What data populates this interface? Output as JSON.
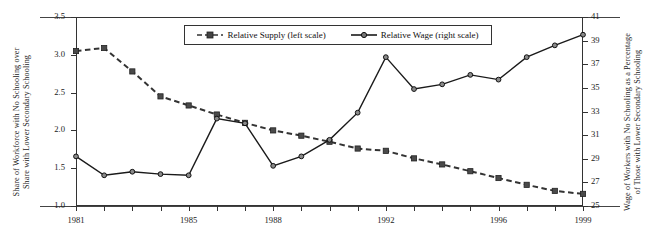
{
  "chart_data": {
    "type": "line",
    "title": "",
    "subtitle": "",
    "xlabel": "",
    "ylabel": "Share of Workforce with No Schooling over Share with Lower Secondary Schooling",
    "ylabel_right": "Wage of Workers with No Schooling as a Percentage of Those with Lower Secondary Schooling",
    "x": [
      1981,
      1982,
      1983,
      1984,
      1985,
      1986,
      1987,
      1988,
      1989,
      1990,
      1991,
      1992,
      1993,
      1994,
      1995,
      1996,
      1997,
      1998,
      1999
    ],
    "xtick_labels": [
      "1981",
      "1985",
      "1988",
      "1992",
      "1996",
      "1999"
    ],
    "xtick_values": [
      1981,
      1985,
      1988,
      1992,
      1996,
      1999
    ],
    "ylim": [
      1.0,
      3.5
    ],
    "ytick_labels": [
      "3.5",
      "3.0",
      "2.5",
      "2.0",
      "1.5",
      "1.0"
    ],
    "ytick_values": [
      3.5,
      3.0,
      2.5,
      2.0,
      1.5,
      1.0
    ],
    "ylim_right": [
      25,
      41
    ],
    "ytick_labels_right": [
      "41",
      "39",
      "37",
      "35",
      "33",
      "31",
      "29",
      "27",
      "25"
    ],
    "ytick_values_right": [
      41,
      39,
      37,
      35,
      33,
      31,
      29,
      27,
      25
    ],
    "grid": false,
    "legend_position": "top-center",
    "series": [
      {
        "name": "Relative Supply (left scale)",
        "axis": "left",
        "line_style": "dashed",
        "marker": "square",
        "color": "#333333",
        "values": [
          3.05,
          3.09,
          2.78,
          2.45,
          2.33,
          2.21,
          2.1,
          2.0,
          1.93,
          1.85,
          1.76,
          1.73,
          1.63,
          1.55,
          1.46,
          1.37,
          1.28,
          1.2,
          1.16
        ]
      },
      {
        "name": "Relative Wage (right scale)",
        "axis": "right",
        "line_style": "solid",
        "marker": "circle",
        "color": "#1a1a1a",
        "values": [
          29.2,
          27.6,
          27.9,
          27.7,
          27.6,
          32.4,
          32.0,
          28.4,
          29.2,
          30.6,
          32.9,
          37.6,
          34.9,
          35.3,
          36.1,
          35.7,
          37.6,
          38.6,
          39.5
        ]
      }
    ],
    "annotations": []
  },
  "legend": {
    "items": [
      {
        "label": "Relative Supply (left scale)",
        "marker": "square",
        "style": "dashed"
      },
      {
        "label": "Relative Wage (right scale)",
        "marker": "circle",
        "style": "solid"
      }
    ]
  },
  "axis_titles": {
    "left_line1": "Share of Workforce with No Schooling over",
    "left_line2": "Share with Lower Secondary Schooling",
    "right_line1": "Wage of Workers with No Schooling as a Percentage",
    "right_line2": "of Those with Lower Secondary Schooling"
  }
}
